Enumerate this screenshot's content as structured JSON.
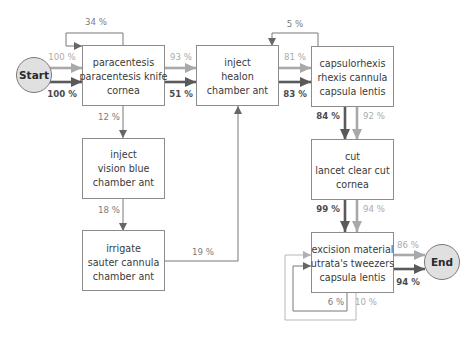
{
  "diagram": {
    "start": {
      "label": "Start"
    },
    "end": {
      "label": "End"
    },
    "nodes": [
      {
        "id": "paracentesis",
        "lines": [
          "paracentesis",
          "paracentesis knife",
          "cornea"
        ]
      },
      {
        "id": "inject-healon",
        "lines": [
          "inject",
          "healon",
          "chamber ant"
        ]
      },
      {
        "id": "capsulorhexis",
        "lines": [
          "capsulorhexis",
          "rhexis cannula",
          "capsula lentis"
        ]
      },
      {
        "id": "cut",
        "lines": [
          "cut",
          "lancet clear cut",
          "cornea"
        ]
      },
      {
        "id": "excision",
        "lines": [
          "excision material",
          "utrata's tweezers",
          "capsula lentis"
        ]
      },
      {
        "id": "inject-vision-blue",
        "lines": [
          "inject",
          "vision blue",
          "chamber ant"
        ]
      },
      {
        "id": "irrigate",
        "lines": [
          "irrigate",
          "sauter cannula",
          "chamber ant"
        ]
      }
    ],
    "edges": [
      {
        "from": "Start",
        "to": "paracentesis",
        "style": "light",
        "label": "100 %"
      },
      {
        "from": "Start",
        "to": "paracentesis",
        "style": "dark",
        "label": "100 %"
      },
      {
        "from": "paracentesis",
        "to": "paracentesis",
        "style": "thin",
        "label": "34 %"
      },
      {
        "from": "paracentesis",
        "to": "inject-healon",
        "style": "light",
        "label": "93 %"
      },
      {
        "from": "paracentesis",
        "to": "inject-healon",
        "style": "dark",
        "label": "51 %"
      },
      {
        "from": "paracentesis",
        "to": "inject-vision-blue",
        "style": "thin",
        "label": "12 %"
      },
      {
        "from": "inject-vision-blue",
        "to": "irrigate",
        "style": "thin",
        "label": "18 %"
      },
      {
        "from": "irrigate",
        "to": "inject-healon",
        "style": "thin",
        "label": "19 %"
      },
      {
        "from": "inject-healon",
        "to": "capsulorhexis",
        "style": "light",
        "label": "81 %"
      },
      {
        "from": "inject-healon",
        "to": "capsulorhexis",
        "style": "dark",
        "label": "83 %"
      },
      {
        "from": "capsulorhexis",
        "to": "inject-healon",
        "style": "thin",
        "label": "5 %"
      },
      {
        "from": "capsulorhexis",
        "to": "cut",
        "style": "dark",
        "label": "84 %"
      },
      {
        "from": "capsulorhexis",
        "to": "cut",
        "style": "light",
        "label": "92 %"
      },
      {
        "from": "cut",
        "to": "excision",
        "style": "dark",
        "label": "99 %"
      },
      {
        "from": "cut",
        "to": "excision",
        "style": "light",
        "label": "94 %"
      },
      {
        "from": "excision",
        "to": "End",
        "style": "light",
        "label": "86 %"
      },
      {
        "from": "excision",
        "to": "End",
        "style": "dark",
        "label": "94 %"
      },
      {
        "from": "excision",
        "to": "excision",
        "style": "thin",
        "label": "6 %"
      },
      {
        "from": "excision",
        "to": "excision",
        "style": "thin-light",
        "label": "10 %"
      }
    ],
    "colors": {
      "dark_flow": "#5a5a5a",
      "light_flow": "#a9a9a9",
      "thin_flow": "#787878",
      "thin_light_flow": "#b8b8b8",
      "node_border": "#8c8c8c",
      "terminal_fill": "#e0e0e0"
    }
  }
}
